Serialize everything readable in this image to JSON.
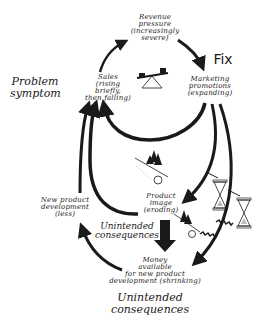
{
  "diagram": {
    "type": "causal-loop / fixes-that-fail archetype",
    "nodes": {
      "revenue_pressure": "Revenue\npressure\n(increasingly\nsevere)",
      "sales": "Sales\n(rising\nbriefly,\nthen falling)",
      "marketing": "Marketing\npromotions\n(expanding)",
      "product_image": "Product\nimage\n(eroding)",
      "new_product_dev": "New product\ndevelopment\n(less)",
      "money": "Money\navailable\nfor new product\ndevelopment (shrinking)"
    },
    "annotations": {
      "fix": "Fix",
      "problem_symptom": "Problem\nsymptom",
      "unintended_middle": "Unintended\nconsequences",
      "unintended_bottom": "Unintended\nconsequences"
    },
    "icons": [
      "balance-seesaw-icon",
      "snowball-tree-icon",
      "hourglass-icon",
      "hourglass-icon",
      "delay-zigzag-icon"
    ],
    "colors": {
      "ink": "#1a1a1a",
      "background": "#ffffff"
    }
  }
}
